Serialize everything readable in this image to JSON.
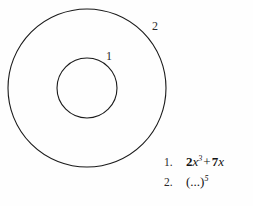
{
  "figure": {
    "type": "concentric-circles-diagram",
    "background_color": "#fefefe",
    "stroke_color": "#1a1a1a",
    "outer_circle": {
      "label": "2",
      "center_x": 87,
      "center_y": 88,
      "radius": 79
    },
    "inner_circle": {
      "label": "1",
      "center_x": 87,
      "center_y": 88,
      "radius": 30
    }
  },
  "formula_list": {
    "items": [
      {
        "index": "1.",
        "coefficient": "2",
        "variable": "x",
        "exponent": "3",
        "operator": "+",
        "term2_coefficient": "7",
        "term2_variable": "x",
        "plain": "2x3 + 7x"
      },
      {
        "index": "2.",
        "open_paren": "(",
        "ellipsis": "...",
        "close_paren": ")",
        "exponent": "5",
        "plain": "(...)5"
      }
    ]
  }
}
